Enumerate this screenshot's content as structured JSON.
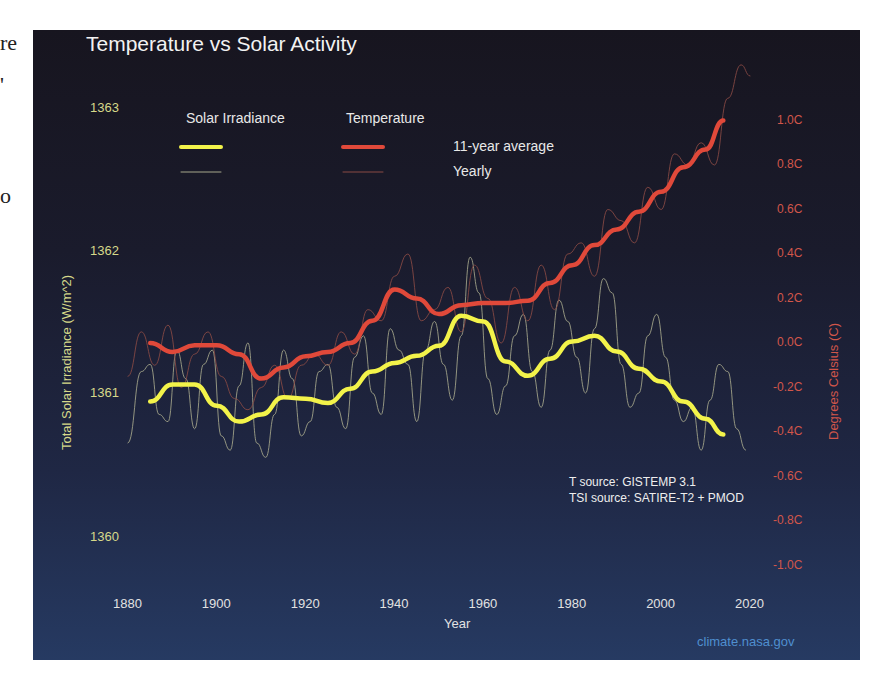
{
  "page": {
    "left_fragments": [
      "re",
      "'",
      "o"
    ]
  },
  "chart_data": {
    "type": "line",
    "title": "Temperature vs Solar Activity",
    "xlabel": "Year",
    "ylabel_left": "Total Solar Irradiance (W/m^2)",
    "ylabel_right": "Degrees Celsius (C)",
    "x_ticks": [
      "1880",
      "1900",
      "1920",
      "1940",
      "1960",
      "1980",
      "2000",
      "2020"
    ],
    "y_left_ticks": [
      "1363",
      "1362",
      "1361",
      "1360"
    ],
    "y_right_ticks": [
      "1.0C",
      "0.8C",
      "0.6C",
      "0.4C",
      "0.2C",
      "0.0C",
      "-0.2C",
      "-0.4C",
      "-0.6C",
      "-0.8C",
      "-1.0C"
    ],
    "xlim": [
      1880,
      2020
    ],
    "ylim_left": [
      1360,
      1363
    ],
    "ylim_right": [
      -1.0,
      1.0
    ],
    "grid": false,
    "legend": {
      "position": "top-left",
      "columns": [
        "Solar Irradiance",
        "Temperature"
      ],
      "rows": [
        "11-year average",
        "Yearly"
      ],
      "entries": [
        {
          "name": "Solar Irradiance 11-year average",
          "color": "#f3f34a",
          "width": 4
        },
        {
          "name": "Temperature 11-year average",
          "color": "#e0493a",
          "width": 4
        },
        {
          "name": "Solar Irradiance Yearly",
          "color": "#a7a88c",
          "width": 1
        },
        {
          "name": "Temperature Yearly",
          "color": "#8a4a44",
          "width": 1
        }
      ]
    },
    "x": [
      1885,
      1890,
      1895,
      1900,
      1905,
      1910,
      1915,
      1920,
      1925,
      1930,
      1935,
      1940,
      1945,
      1950,
      1955,
      1960,
      1965,
      1970,
      1975,
      1980,
      1985,
      1990,
      1995,
      2000,
      2005,
      2010,
      2014
    ],
    "series": [
      {
        "name": "Solar Irradiance (11-year average)",
        "axis": "left",
        "color": "#f3f34a",
        "values": [
          1360.94,
          1361.06,
          1361.06,
          1360.91,
          1360.8,
          1360.85,
          1360.97,
          1360.96,
          1360.93,
          1361.03,
          1361.15,
          1361.21,
          1361.26,
          1361.33,
          1361.54,
          1361.5,
          1361.22,
          1361.12,
          1361.24,
          1361.36,
          1361.4,
          1361.29,
          1361.17,
          1361.08,
          1360.94,
          1360.82,
          1360.71
        ]
      },
      {
        "name": "Temperature (11-year average)",
        "axis": "right",
        "color": "#e0493a",
        "values": [
          0.0,
          -0.04,
          -0.01,
          -0.01,
          -0.05,
          -0.16,
          -0.11,
          -0.06,
          -0.04,
          0.0,
          0.1,
          0.24,
          0.2,
          0.13,
          0.17,
          0.18,
          0.18,
          0.19,
          0.27,
          0.35,
          0.44,
          0.51,
          0.59,
          0.68,
          0.79,
          0.87,
          1.0
        ]
      }
    ],
    "yearly_series": [
      {
        "name": "Solar Irradiance (Yearly)",
        "axis": "left",
        "color": "#a7a88c",
        "x": [
          1880,
          1883,
          1885,
          1887,
          1889,
          1891,
          1893,
          1895,
          1897,
          1899,
          1901,
          1903,
          1905,
          1907,
          1909,
          1911,
          1913,
          1915,
          1917,
          1919,
          1921,
          1923,
          1925,
          1927,
          1929,
          1931,
          1933,
          1935,
          1937,
          1939,
          1941,
          1943,
          1945,
          1947,
          1949,
          1951,
          1953,
          1955,
          1957,
          1959,
          1961,
          1963,
          1965,
          1967,
          1969,
          1971,
          1973,
          1975,
          1977,
          1979,
          1981,
          1983,
          1985,
          1987,
          1989,
          1991,
          1993,
          1995,
          1997,
          1999,
          2001,
          2003,
          2005,
          2007,
          2009,
          2011,
          2013,
          2015,
          2017,
          2019
        ],
        "values": [
          1360.65,
          1361.15,
          1361.2,
          1360.85,
          1360.8,
          1361.3,
          1361.1,
          1360.75,
          1361.2,
          1361.3,
          1360.7,
          1360.6,
          1361.05,
          1361.35,
          1360.65,
          1360.55,
          1360.85,
          1361.3,
          1361.1,
          1360.7,
          1360.8,
          1361.15,
          1361.2,
          1360.9,
          1360.75,
          1361.25,
          1361.4,
          1361.0,
          1360.85,
          1361.45,
          1361.3,
          1361.2,
          1360.8,
          1361.3,
          1361.5,
          1361.2,
          1360.95,
          1361.4,
          1361.95,
          1361.7,
          1361.1,
          1360.85,
          1361.05,
          1361.4,
          1361.55,
          1361.15,
          1360.9,
          1361.3,
          1361.65,
          1361.5,
          1361.25,
          1361.0,
          1361.45,
          1361.8,
          1361.7,
          1361.2,
          1360.9,
          1361.0,
          1361.4,
          1361.55,
          1361.25,
          1360.95,
          1360.8,
          1360.9,
          1360.6,
          1360.95,
          1361.2,
          1361.15,
          1360.75,
          1360.6
        ]
      },
      {
        "name": "Temperature (Yearly)",
        "axis": "right",
        "color": "#8a4a44",
        "x": [
          1880,
          1883,
          1886,
          1889,
          1892,
          1895,
          1898,
          1901,
          1904,
          1907,
          1910,
          1913,
          1916,
          1919,
          1922,
          1925,
          1928,
          1931,
          1934,
          1937,
          1940,
          1943,
          1946,
          1949,
          1952,
          1955,
          1958,
          1961,
          1964,
          1967,
          1970,
          1973,
          1976,
          1979,
          1982,
          1985,
          1988,
          1991,
          1994,
          1997,
          2000,
          2003,
          2006,
          2009,
          2012,
          2015,
          2018,
          2020
        ],
        "values": [
          -0.15,
          0.05,
          -0.1,
          0.08,
          -0.2,
          -0.05,
          0.05,
          -0.15,
          -0.25,
          -0.3,
          -0.2,
          -0.1,
          -0.25,
          -0.1,
          -0.05,
          -0.1,
          0.05,
          -0.05,
          0.15,
          0.1,
          0.3,
          0.4,
          0.1,
          0.15,
          0.25,
          0.05,
          0.35,
          0.2,
          0.0,
          0.25,
          0.1,
          0.35,
          0.15,
          0.4,
          0.45,
          0.3,
          0.6,
          0.55,
          0.45,
          0.7,
          0.6,
          0.85,
          0.8,
          0.9,
          0.8,
          1.1,
          1.25,
          1.2
        ]
      }
    ],
    "annotations": [
      "T source: GISTEMP 3.1",
      "TSI source: SATIRE-T2 + PMOD"
    ],
    "credit": "climate.nasa.gov"
  }
}
